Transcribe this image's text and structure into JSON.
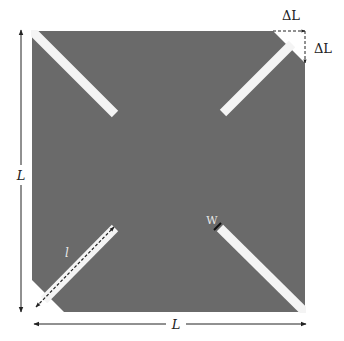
{
  "diagram": {
    "colors": {
      "patch": "#6a6a6a",
      "slot": "#f4f4f4",
      "annotation": "#222222",
      "background": "#ffffff"
    },
    "labels": {
      "side_length_vertical": "L",
      "side_length_horizontal": "L",
      "corner_cut_horizontal": "ΔL",
      "corner_cut_vertical": "ΔL",
      "slot_length": "l",
      "slot_width": "W"
    },
    "slots": [
      {
        "position": "top-left",
        "corner_truncated": false
      },
      {
        "position": "top-right",
        "corner_truncated": true
      },
      {
        "position": "bottom-left",
        "corner_truncated": true
      },
      {
        "position": "bottom-right",
        "corner_truncated": false
      }
    ]
  }
}
